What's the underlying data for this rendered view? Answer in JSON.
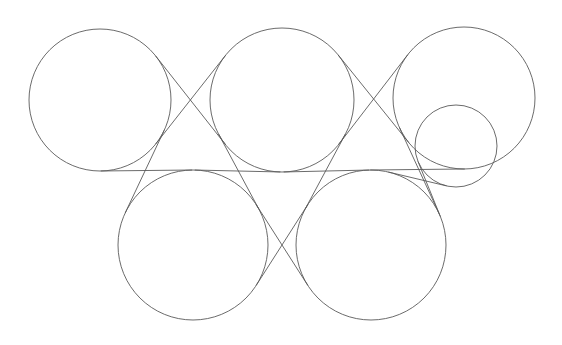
{
  "figure": {
    "type": "geometric-line-diagram",
    "canvas": {
      "width": 562,
      "height": 345,
      "background_color": "#ffffff"
    },
    "style": {
      "stroke_color": "#5a5a5a",
      "stroke_width": 0.9,
      "fill": "none"
    },
    "circles": [
      {
        "id": "circle-top-left",
        "label": "Top left large circle",
        "cx": 100,
        "cy": 100,
        "r": 71
      },
      {
        "id": "circle-top-middle",
        "label": "Top middle large circle",
        "cx": 282,
        "cy": 100,
        "r": 72
      },
      {
        "id": "circle-top-right",
        "label": "Top right large circle",
        "cx": 464,
        "cy": 98,
        "r": 71
      },
      {
        "id": "circle-small-right",
        "label": "Small circle inside top right circle",
        "cx": 456,
        "cy": 146,
        "r": 41
      },
      {
        "id": "circle-bottom-left",
        "label": "Bottom left large circle",
        "cx": 193,
        "cy": 245,
        "r": 75
      },
      {
        "id": "circle-bottom-right",
        "label": "Bottom right large circle",
        "cx": 371,
        "cy": 245,
        "r": 75
      }
    ],
    "tangent_lines": [
      {
        "id": "tangent-tl-to-bl-outer",
        "label": "Tangent from top left circle down to bottom left circle (left branch)",
        "x1": 32,
        "y1": 123,
        "x2": 136,
        "y2": 312
      },
      {
        "id": "tangent-tl-to-bl-cross",
        "label": "Tangent from top left circle crossing to bottom left circle (right branch)",
        "x1": 168,
        "y1": 122,
        "x2": 122,
        "y2": 210
      },
      {
        "id": "tangent-tl-to-tm-x1",
        "label": "Internal tangent crossing between top left and top middle circles (upper left to lower right)",
        "x1": 160,
        "y1": 60,
        "x2": 232,
        "y2": 155
      },
      {
        "id": "tangent-tl-to-tm-x2",
        "label": "Internal tangent crossing between top left and top middle circles (lower left to upper right)",
        "x1": 150,
        "y1": 145,
        "x2": 226,
        "y2": 45
      },
      {
        "id": "tangent-tm-to-bl",
        "label": "Tangent from top middle circle to bottom left circle",
        "x1": 215,
        "y1": 122,
        "x2": 252,
        "y2": 300
      },
      {
        "id": "tangent-tm-to-br",
        "label": "Tangent from top middle circle to bottom right circle",
        "x1": 348,
        "y1": 122,
        "x2": 310,
        "y2": 300
      },
      {
        "id": "tangent-tm-to-tr-x1",
        "label": "Internal tangent crossing between top middle and top right circles (upper left to lower right)",
        "x1": 342,
        "y1": 60,
        "x2": 414,
        "y2": 155
      },
      {
        "id": "tangent-tm-to-tr-x2",
        "label": "Internal tangent crossing between top middle and top right circles (lower left to upper right)",
        "x1": 332,
        "y1": 145,
        "x2": 408,
        "y2": 45
      },
      {
        "id": "tangent-bl-to-br-x1",
        "label": "Internal tangent crossing between bottom left and bottom right circles (upper left to lower right)",
        "x1": 240,
        "y1": 205,
        "x2": 320,
        "y2": 300
      },
      {
        "id": "tangent-bl-to-br-x2",
        "label": "Internal tangent crossing between bottom left and bottom right circles (lower left to upper right)",
        "x1": 240,
        "y1": 300,
        "x2": 320,
        "y2": 205
      },
      {
        "id": "tangent-tr-to-br",
        "label": "Tangent from top right circle down to bottom right circle",
        "x1": 505,
        "y1": 140,
        "x2": 420,
        "y2": 290
      },
      {
        "id": "tangent-small-to-br",
        "label": "Tangent from small circle down to bottom right circle",
        "x1": 415,
        "y1": 135,
        "x2": 440,
        "y2": 290
      }
    ],
    "counts": {
      "circles": 6,
      "tangent_lines": 12
    }
  }
}
